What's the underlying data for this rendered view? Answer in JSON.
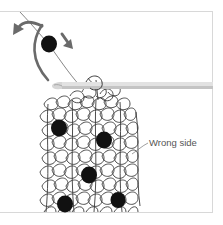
{
  "diagram": {
    "label": "Wrong side",
    "colors": {
      "background": "#ffffff",
      "frame_border": "#d8d8d8",
      "yarn": "#3a3a3a",
      "bead": "#111111",
      "arrow": "#666666",
      "hook_light": "#e4e4e4",
      "hook_shade": "#bdbdbd",
      "label_text": "#555555"
    },
    "elements": {
      "top_bead": {
        "cx": 49,
        "cy": 44,
        "r": 8
      },
      "fabric_beads": [
        {
          "cx": 59,
          "cy": 128,
          "r": 8
        },
        {
          "cx": 104,
          "cy": 140,
          "r": 8
        },
        {
          "cx": 89,
          "cy": 175,
          "r": 8
        },
        {
          "cx": 118,
          "cy": 200,
          "r": 7
        },
        {
          "cx": 65,
          "cy": 204,
          "r": 8
        }
      ],
      "hook": {
        "x1": 52,
        "y1": 86,
        "x2": 213,
        "y2": 86
      },
      "arrows": [
        "curved-arrow-left",
        "curved-arc",
        "straight-arrow-down-right"
      ]
    }
  }
}
